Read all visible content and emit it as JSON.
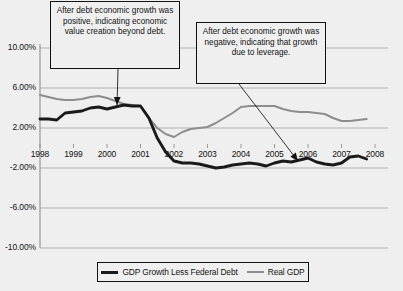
{
  "chart_data": {
    "type": "line",
    "title": "",
    "xlabel": "",
    "ylabel": "",
    "xlim": [
      1998,
      2008
    ],
    "ylim": [
      -10,
      10
    ],
    "grid": true,
    "legend_position": "bottom",
    "x_tick_labels": [
      "1998",
      "1999",
      "2000",
      "2001",
      "2002",
      "2003",
      "2004",
      "2005",
      "2006",
      "2007",
      "2008"
    ],
    "y_tick_labels": [
      "10.00%",
      "6.00%",
      "2.00%",
      "-2.00%",
      "-6.00%",
      "-10.00%"
    ],
    "y_tick_values": [
      10,
      6,
      2,
      -2,
      -6,
      -10
    ],
    "series": [
      {
        "name": "GDP Growth Less Federal Debt",
        "color": "#1a1a1a",
        "x": [
          1998.0,
          1998.25,
          1998.5,
          1998.75,
          1999.0,
          1999.25,
          1999.5,
          1999.75,
          2000.0,
          2000.25,
          2000.5,
          2000.75,
          2001.0,
          2001.25,
          2001.5,
          2001.75,
          2002.0,
          2002.25,
          2002.5,
          2002.75,
          2003.0,
          2003.25,
          2003.5,
          2003.75,
          2004.0,
          2004.25,
          2004.5,
          2004.75,
          2005.0,
          2005.25,
          2005.5,
          2005.75,
          2006.0,
          2006.25,
          2006.5,
          2006.75,
          2007.0,
          2007.25,
          2007.5,
          2007.75
        ],
        "y": [
          2.9,
          2.9,
          2.8,
          3.5,
          3.6,
          3.7,
          4.0,
          4.1,
          3.9,
          4.1,
          4.3,
          4.2,
          4.2,
          3.0,
          1.0,
          -0.4,
          -1.3,
          -1.5,
          -1.5,
          -1.6,
          -1.8,
          -2.0,
          -1.9,
          -1.7,
          -1.6,
          -1.5,
          -1.6,
          -1.8,
          -1.5,
          -1.3,
          -1.4,
          -1.2,
          -1.0,
          -1.4,
          -1.6,
          -1.7,
          -1.5,
          -0.9,
          -0.8,
          -1.1
        ]
      },
      {
        "name": "Real GDP",
        "color": "#8d8d8d",
        "x": [
          1998.0,
          1998.25,
          1998.5,
          1998.75,
          1999.0,
          1999.25,
          1999.5,
          1999.75,
          2000.0,
          2000.25,
          2000.5,
          2000.75,
          2001.0,
          2001.25,
          2001.5,
          2001.75,
          2002.0,
          2002.25,
          2002.5,
          2002.75,
          2003.0,
          2003.25,
          2003.5,
          2003.75,
          2004.0,
          2004.25,
          2004.5,
          2004.75,
          2005.0,
          2005.25,
          2005.5,
          2005.75,
          2006.0,
          2006.25,
          2006.5,
          2006.75,
          2007.0,
          2007.25,
          2007.5,
          2007.75
        ],
        "y": [
          5.3,
          5.1,
          4.9,
          4.8,
          4.8,
          4.9,
          5.1,
          5.2,
          5.0,
          4.7,
          4.4,
          4.3,
          4.2,
          3.0,
          2.0,
          1.4,
          1.1,
          1.6,
          1.9,
          2.0,
          2.1,
          2.5,
          3.0,
          3.5,
          4.1,
          4.2,
          4.2,
          4.2,
          4.2,
          3.9,
          3.7,
          3.6,
          3.6,
          3.5,
          3.4,
          3.0,
          2.7,
          2.7,
          2.8,
          2.9
        ]
      }
    ],
    "annotations": [
      {
        "id": "callout-left",
        "text": "After debt economic growth was positive, indicating economic value creation beyond debt.",
        "points_to_x": 2000.3,
        "points_to_y": 4.3
      },
      {
        "id": "callout-right",
        "text": "After debt economic growth was negative, indicating that growth due to leverage.",
        "points_to_x": 2005.7,
        "points_to_y": -1.3
      }
    ]
  },
  "legend": {
    "items": [
      {
        "label": "GDP Growth Less Federal Debt",
        "swatch": "dark"
      },
      {
        "label": "Real GDP",
        "swatch": "gray"
      }
    ]
  },
  "axis": {
    "y_labels": [
      "10.00%",
      "6.00%",
      "2.00%",
      "-2.00%",
      "-6.00%",
      "-10.00%"
    ],
    "x_labels": [
      "1998",
      "1999",
      "2000",
      "2001",
      "2002",
      "2003",
      "2004",
      "2005",
      "2006",
      "2007",
      "2008"
    ]
  },
  "annotations": {
    "left_text": "After debt economic growth was positive, indicating economic value creation beyond debt.",
    "right_text": "After debt economic growth was negative, indicating that growth due to leverage."
  },
  "colors": {
    "background": "#efefef",
    "gridline": "#a9a9a9",
    "axis": "#8f8f8f",
    "series_dark": "#1a1a1a",
    "series_gray": "#8d8d8d",
    "text": "#111111"
  }
}
